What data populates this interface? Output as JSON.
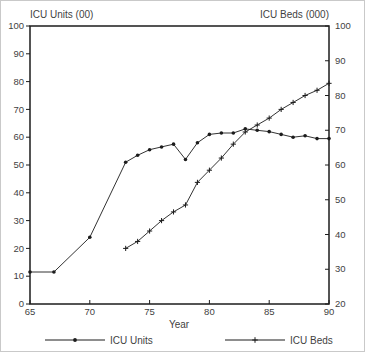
{
  "figure": {
    "colors": {
      "line": "#1c1c1c",
      "frame": "#1c1c1c",
      "text": "#3f3f3f",
      "background": "#ffffff",
      "border": "#c9c9c9"
    }
  },
  "chart_data": {
    "type": "line",
    "title": "",
    "xlabel": "Year",
    "grid": false,
    "legend_position": "bottom",
    "x_axis": {
      "range": [
        65,
        90
      ],
      "ticks": [
        65,
        70,
        75,
        80,
        85,
        90
      ]
    },
    "left_axis": {
      "title": "ICU Units (00)",
      "range": [
        0,
        100
      ],
      "ticks": [
        0,
        10,
        20,
        30,
        40,
        50,
        60,
        70,
        80,
        90,
        100
      ]
    },
    "right_axis": {
      "title": "ICU Beds (000)",
      "range": [
        20,
        100
      ],
      "ticks": [
        20,
        30,
        40,
        50,
        60,
        70,
        80,
        90,
        100
      ]
    },
    "series": [
      {
        "name": "ICU Units",
        "axis": "left",
        "marker": "dot",
        "x": [
          65,
          67,
          70,
          73,
          74,
          75,
          76,
          77,
          78,
          79,
          80,
          81,
          82,
          83,
          84,
          85,
          86,
          87,
          88,
          89,
          90
        ],
        "values": [
          11.5,
          11.5,
          24,
          51,
          53.5,
          55.5,
          56.5,
          57.5,
          52,
          58,
          61,
          61.5,
          61.5,
          63,
          62.5,
          62,
          61,
          60,
          60.5,
          59.5,
          59.5
        ]
      },
      {
        "name": "ICU Beds",
        "axis": "right",
        "marker": "plus",
        "x": [
          73,
          74,
          75,
          76,
          77,
          78,
          79,
          80,
          81,
          82,
          83,
          84,
          85,
          86,
          87,
          88,
          89,
          90
        ],
        "values": [
          36,
          38,
          41,
          44,
          46.5,
          48.5,
          55,
          58.5,
          62,
          66,
          69.5,
          71.5,
          73.5,
          76,
          78,
          80,
          81.5,
          83.5
        ]
      }
    ]
  }
}
